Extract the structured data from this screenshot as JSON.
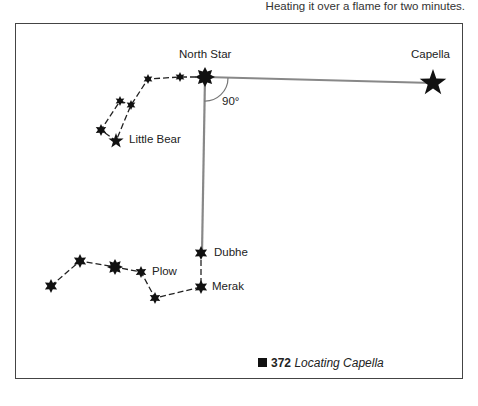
{
  "header": {
    "caption_text": "Heating it over a flame for two minutes."
  },
  "diagram": {
    "labels": {
      "north_star": "North Star",
      "capella": "Capella",
      "angle": "90°",
      "little_bear": "Little Bear",
      "dubhe": "Dubhe",
      "merak": "Merak",
      "plow": "Plow"
    },
    "line_color": "#888888",
    "star_color": "#111111"
  },
  "figure": {
    "number": "372",
    "title": "Locating Capella"
  }
}
